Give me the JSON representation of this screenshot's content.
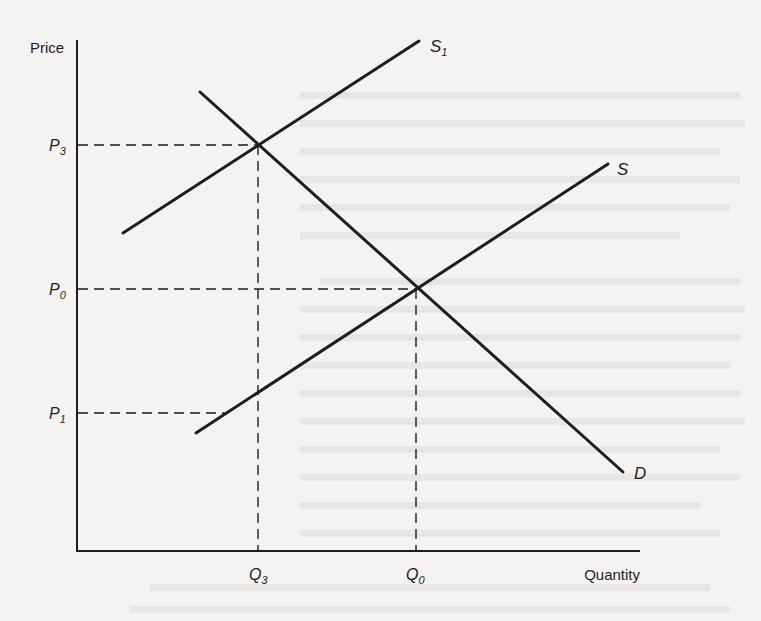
{
  "figure": {
    "type": "supply-demand diagram",
    "axes": {
      "y_label": "Price",
      "x_label": "Quantity"
    },
    "price_levels": [
      {
        "id": "P3",
        "base": "P",
        "sub": "3"
      },
      {
        "id": "P0",
        "base": "P",
        "sub": "0"
      },
      {
        "id": "P1",
        "base": "P",
        "sub": "1"
      }
    ],
    "quantity_levels": [
      {
        "id": "Q3",
        "base": "Q",
        "sub": "3"
      },
      {
        "id": "Q0",
        "base": "Q",
        "sub": "0"
      }
    ],
    "curves": [
      {
        "id": "S1",
        "base": "S",
        "sub": "1",
        "kind": "supply (shifted)"
      },
      {
        "id": "S",
        "base": "S",
        "sub": "",
        "kind": "supply"
      },
      {
        "id": "D",
        "base": "D",
        "sub": "",
        "kind": "demand"
      }
    ],
    "equilibria": [
      {
        "curves": [
          "S",
          "D"
        ],
        "price": "P0",
        "quantity": "Q0"
      },
      {
        "curves": [
          "S1",
          "D"
        ],
        "price": "P3",
        "quantity": "Q3"
      }
    ]
  },
  "colors": {
    "ink": "#1e1e1e",
    "paper": "#f4f3f1",
    "bleed_through": "#d9d8d5"
  }
}
